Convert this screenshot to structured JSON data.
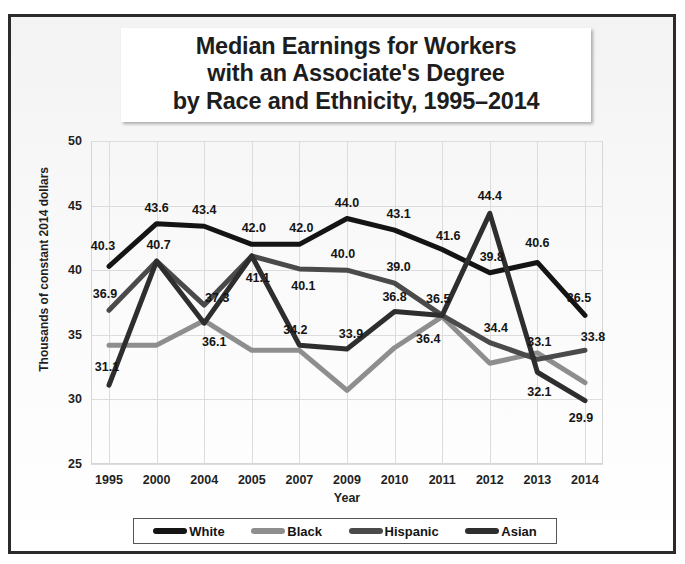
{
  "chart_data": {
    "type": "line",
    "title": "Median Earnings for Workers with an Associate's Degree by Race and Ethnicity, 1995–2014",
    "title_lines": [
      "Median Earnings for Workers",
      "with an Associate's Degree",
      "by Race and Ethnicity, 1995–2014"
    ],
    "xlabel": "Year",
    "ylabel": "Thousands of constant 2014 dollars",
    "categories": [
      "1995",
      "2000",
      "2004",
      "2005",
      "2007",
      "2009",
      "2010",
      "2011",
      "2012",
      "2013",
      "2014"
    ],
    "ylim": [
      25,
      50
    ],
    "yticks": [
      25,
      30,
      35,
      40,
      45,
      50
    ],
    "grid": true,
    "legend_position": "bottom",
    "series": [
      {
        "name": "White",
        "color": "#141414",
        "values": [
          40.3,
          43.6,
          43.4,
          42.0,
          42.0,
          44.0,
          43.1,
          41.6,
          39.8,
          40.6,
          36.5
        ],
        "labels": [
          "40.3",
          "43.6",
          "43.4",
          "42.0",
          "42.0",
          "44.0",
          "43.1",
          "41.6",
          "39.8",
          "40.6",
          "36.5"
        ]
      },
      {
        "name": "Black",
        "color": "#8e8e8e",
        "values": [
          34.2,
          34.2,
          36.1,
          33.8,
          33.8,
          30.7,
          34.0,
          36.4,
          32.8,
          33.6,
          31.3
        ],
        "labels": [
          "",
          "",
          "36.1",
          "",
          "",
          "",
          "",
          "36.4",
          "",
          "",
          ""
        ]
      },
      {
        "name": "Hispanic",
        "color": "#4a4a4a",
        "values": [
          36.9,
          40.7,
          37.3,
          41.1,
          40.1,
          40.0,
          39.0,
          36.5,
          34.4,
          33.1,
          33.8
        ],
        "labels": [
          "36.9",
          "40.7",
          "37.3",
          "41.1",
          "40.1",
          "40.0",
          "39.0",
          "36.5",
          "34.4",
          "33.1",
          "33.8"
        ]
      },
      {
        "name": "Asian",
        "color": "#2e2e2e",
        "values": [
          31.1,
          40.7,
          35.9,
          41.1,
          34.2,
          33.9,
          36.8,
          36.5,
          44.4,
          32.1,
          29.9
        ],
        "labels": [
          "31.1",
          "",
          "",
          "",
          "34.2",
          "33.9",
          "36.8",
          "",
          "44.4",
          "32.1",
          "29.9"
        ]
      }
    ],
    "data_labels": [
      {
        "text": "40.3",
        "series": "White",
        "x": 0,
        "value": 40.3,
        "dx": -6,
        "dy": -20
      },
      {
        "text": "43.6",
        "series": "White",
        "x": 1,
        "value": 43.6,
        "dx": 0,
        "dy": -16
      },
      {
        "text": "43.4",
        "series": "White",
        "x": 2,
        "value": 43.4,
        "dx": 0,
        "dy": -16
      },
      {
        "text": "42.0",
        "series": "White",
        "x": 3,
        "value": 42.0,
        "dx": 2,
        "dy": -16
      },
      {
        "text": "42.0",
        "series": "White",
        "x": 4,
        "value": 42.0,
        "dx": 2,
        "dy": -16
      },
      {
        "text": "44.0",
        "series": "White",
        "x": 5,
        "value": 44.0,
        "dx": 0,
        "dy": -16
      },
      {
        "text": "43.1",
        "series": "White",
        "x": 6,
        "value": 43.1,
        "dx": 4,
        "dy": -16
      },
      {
        "text": "41.6",
        "series": "White",
        "x": 7,
        "value": 41.6,
        "dx": 6,
        "dy": -14
      },
      {
        "text": "39.8",
        "series": "White",
        "x": 8,
        "value": 39.8,
        "dx": 2,
        "dy": -16
      },
      {
        "text": "40.6",
        "series": "White",
        "x": 9,
        "value": 40.6,
        "dx": 0,
        "dy": -19
      },
      {
        "text": "36.5",
        "series": "White",
        "x": 10,
        "value": 36.5,
        "dx": -6,
        "dy": -17
      },
      {
        "text": "36.9",
        "series": "Hispanic",
        "x": 0,
        "value": 36.9,
        "dx": -4,
        "dy": -16
      },
      {
        "text": "40.7",
        "series": "Hispanic",
        "x": 1,
        "value": 40.7,
        "dx": 2,
        "dy": -16
      },
      {
        "text": "37.3",
        "series": "Hispanic",
        "x": 2,
        "value": 37.3,
        "dx": 13,
        "dy": -7
      },
      {
        "text": "41.1",
        "series": "Hispanic",
        "x": 3,
        "value": 41.1,
        "dx": 6,
        "dy": 22
      },
      {
        "text": "40.1",
        "series": "Hispanic",
        "x": 4,
        "value": 40.1,
        "dx": 4,
        "dy": 17
      },
      {
        "text": "40.0",
        "series": "Hispanic",
        "x": 5,
        "value": 40.0,
        "dx": -4,
        "dy": -16
      },
      {
        "text": "39.0",
        "series": "Hispanic",
        "x": 6,
        "value": 39.0,
        "dx": 4,
        "dy": -16
      },
      {
        "text": "36.5",
        "series": "Hispanic",
        "x": 7,
        "value": 36.5,
        "dx": -4,
        "dy": -16
      },
      {
        "text": "34.4",
        "series": "Hispanic",
        "x": 8,
        "value": 34.4,
        "dx": 6,
        "dy": -15
      },
      {
        "text": "33.1",
        "series": "Hispanic",
        "x": 9,
        "value": 33.1,
        "dx": 2,
        "dy": -17
      },
      {
        "text": "33.8",
        "series": "Hispanic",
        "x": 10,
        "value": 33.8,
        "dx": 8,
        "dy": -13
      },
      {
        "text": "31.1",
        "series": "Asian",
        "x": 0,
        "value": 31.1,
        "dx": -2,
        "dy": -18
      },
      {
        "text": "34.2",
        "series": "Asian",
        "x": 4,
        "value": 34.2,
        "dx": -4,
        "dy": -15
      },
      {
        "text": "33.9",
        "series": "Asian",
        "x": 5,
        "value": 33.9,
        "dx": 4,
        "dy": -15
      },
      {
        "text": "36.8",
        "series": "Asian",
        "x": 6,
        "value": 36.8,
        "dx": 0,
        "dy": -15
      },
      {
        "text": "44.4",
        "series": "Asian",
        "x": 8,
        "value": 44.4,
        "dx": 0,
        "dy": -17
      },
      {
        "text": "32.1",
        "series": "Asian",
        "x": 9,
        "value": 32.1,
        "dx": 2,
        "dy": 20
      },
      {
        "text": "29.9",
        "series": "Asian",
        "x": 10,
        "value": 29.9,
        "dx": -4,
        "dy": 17
      },
      {
        "text": "36.1",
        "series": "Black",
        "x": 2,
        "value": 36.1,
        "dx": 10,
        "dy": 21
      },
      {
        "text": "36.4",
        "series": "Black",
        "x": 7,
        "value": 36.4,
        "dx": -14,
        "dy": 22
      }
    ],
    "legend": [
      {
        "label": "White",
        "color": "#141414"
      },
      {
        "label": "Black",
        "color": "#8e8e8e"
      },
      {
        "label": "Hispanic",
        "color": "#4a4a4a"
      },
      {
        "label": "Asian",
        "color": "#2e2e2e"
      }
    ]
  }
}
